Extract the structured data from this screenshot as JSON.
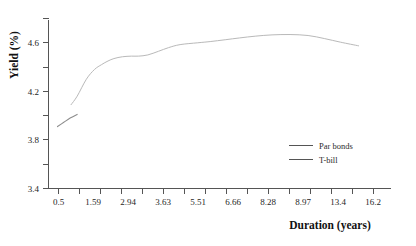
{
  "chart_data": {
    "type": "line",
    "title": "",
    "xlabel": "Duration (years)",
    "ylabel": "Yield (%)",
    "ylim": [
      3.4,
      4.8
    ],
    "xlim": [
      0,
      19
    ],
    "grid": false,
    "legend_position": "center-right",
    "y_ticks_major": [
      "4.6",
      "4.2",
      "3.8",
      "3.4"
    ],
    "y_tick_values": [
      4.6,
      4.2,
      3.8,
      3.4
    ],
    "y_minor_tick_values": [
      4.8,
      4.4,
      4.0,
      3.6
    ],
    "x_tick_labels": [
      "0.5",
      "1.59",
      "2.94",
      "3.63",
      "5.51",
      "6.66",
      "8.28",
      "8.97",
      "13.4",
      "16.2"
    ],
    "x_tick_values": [
      0.5,
      1.59,
      2.94,
      3.63,
      5.51,
      6.66,
      8.28,
      8.97,
      13.4,
      16.2
    ],
    "series": [
      {
        "name": "Par bonds",
        "color": "#b9b9b9",
        "x": [
          1.25,
          1.59,
          2.1,
          2.55,
          2.94,
          3.3,
          3.63,
          4.1,
          4.6,
          5.0,
          5.51,
          6.1,
          6.66,
          7.3,
          8.28,
          8.97,
          9.8,
          10.6,
          11.5,
          12.4,
          13.4,
          14.4,
          15.3,
          16.2,
          17.2
        ],
        "values": [
          4.09,
          4.16,
          4.3,
          4.38,
          4.42,
          4.45,
          4.47,
          4.485,
          4.49,
          4.49,
          4.5,
          4.53,
          4.56,
          4.585,
          4.6,
          4.61,
          4.625,
          4.64,
          4.655,
          4.665,
          4.668,
          4.66,
          4.635,
          4.605,
          4.575
        ],
        "values_tail": [
          4.55,
          4.535
        ]
      },
      {
        "name": "T-bill",
        "color": "#8d8d8d",
        "x": [
          0.5,
          0.85,
          1.2,
          1.59
        ],
        "values": [
          3.91,
          3.945,
          3.98,
          4.01
        ]
      }
    ]
  },
  "legend": {
    "items": [
      {
        "label": "Par bonds",
        "color": "#b9b9b9"
      },
      {
        "label": "T-bill",
        "color": "#8d8d8d"
      }
    ]
  },
  "axes": {
    "x_title": "Duration (years)",
    "y_title": "Yield (%)"
  }
}
